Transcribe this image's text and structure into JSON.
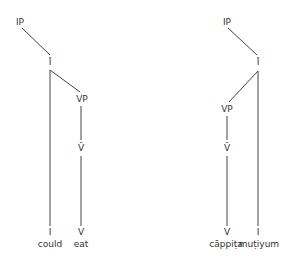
{
  "diagram": {
    "title": "",
    "colors": {
      "line": "#444444",
      "text": "#333333",
      "background": "#ffffff"
    },
    "trees": [
      {
        "id": "english",
        "nodes": {
          "ip": "IP",
          "ibar": "Ī",
          "vp": "VP",
          "vbar": "V̄",
          "i": "I",
          "v": "V"
        },
        "words": {
          "i": "could",
          "v": "eat"
        }
      },
      {
        "id": "tamil",
        "nodes": {
          "ip": "IP",
          "ibar": "Ī",
          "vp": "VP",
          "vbar": "V̄",
          "v": "V",
          "i": "I"
        },
        "words": {
          "v": "cāppiṭa",
          "i": "muṭiyum"
        }
      }
    ],
    "edges": [
      {
        "tree": 0,
        "from": "IP",
        "to": "Ī"
      },
      {
        "tree": 0,
        "from": "Ī",
        "to": "I"
      },
      {
        "tree": 0,
        "from": "Ī",
        "to": "VP"
      },
      {
        "tree": 0,
        "from": "VP",
        "to": "V̄"
      },
      {
        "tree": 0,
        "from": "V̄",
        "to": "V"
      },
      {
        "tree": 1,
        "from": "IP",
        "to": "Ī"
      },
      {
        "tree": 1,
        "from": "Ī",
        "to": "VP"
      },
      {
        "tree": 1,
        "from": "Ī",
        "to": "I"
      },
      {
        "tree": 1,
        "from": "VP",
        "to": "V̄"
      },
      {
        "tree": 1,
        "from": "V̄",
        "to": "V"
      }
    ]
  }
}
